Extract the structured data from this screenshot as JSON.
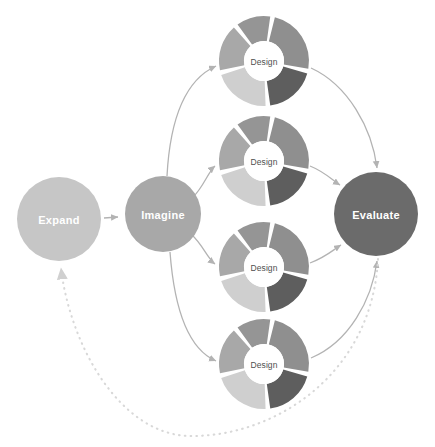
{
  "canvas": {
    "width": 435,
    "height": 447,
    "background": "#ffffff"
  },
  "colors": {
    "expand": "#c6c6c6",
    "imagine": "#a8a8a8",
    "evaluate": "#6b6b6b",
    "arrow": "#b3b3b3",
    "dotted": "#d8d8d8",
    "donut_gap": "#ffffff",
    "hub_fill": "#ffffff",
    "hub_text": "#4f4f4f",
    "node_text": "#ffffff",
    "wedge_light": "#d0d0d0",
    "wedge_light2": "#bdbdbd",
    "wedge_mid": "#a8a8a8",
    "wedge_mid2": "#959595",
    "wedge_dark": "#5e5e5e"
  },
  "nodes": [
    {
      "id": "expand",
      "label": "Expand",
      "cx": 59,
      "cy": 219,
      "r": 42,
      "fill": "#c6c6c6"
    },
    {
      "id": "imagine",
      "label": "Imagine",
      "cx": 163,
      "cy": 214,
      "r": 38,
      "fill": "#a8a8a8"
    },
    {
      "id": "evaluate",
      "label": "Evaluate",
      "cx": 376,
      "cy": 214,
      "r": 42,
      "fill": "#6b6b6b"
    }
  ],
  "donuts": [
    {
      "id": "design-1",
      "label": "Design",
      "cx": 264,
      "cy": 61,
      "r_outer": 45,
      "r_inner": 20
    },
    {
      "id": "design-2",
      "label": "Design",
      "cx": 264,
      "cy": 161,
      "r_outer": 45,
      "r_inner": 20
    },
    {
      "id": "design-3",
      "label": "Design",
      "cx": 264,
      "cy": 267,
      "r_outer": 45,
      "r_inner": 20
    },
    {
      "id": "design-4",
      "label": "Design",
      "cx": 264,
      "cy": 364,
      "r_outer": 45,
      "r_inner": 20
    }
  ],
  "donut_segments": [
    {
      "name": "segment-top-left",
      "start": 258,
      "end": 318,
      "fill": "#a8a8a8"
    },
    {
      "name": "segment-top-right",
      "start": 324,
      "end": 8,
      "fill": "#959595"
    },
    {
      "name": "segment-right",
      "start": 14,
      "end": 100,
      "fill": "#8f8f8f"
    },
    {
      "name": "segment-bottom",
      "start": 106,
      "end": 172,
      "fill": "#5e5e5e"
    },
    {
      "name": "segment-left",
      "start": 178,
      "end": 252,
      "fill": "#cfcfcf"
    }
  ],
  "edges": [
    {
      "name": "expand-to-imagine",
      "type": "solid",
      "from": "expand",
      "to": "imagine"
    },
    {
      "name": "imagine-to-design-1",
      "type": "solid",
      "from": "imagine",
      "to": "design-1"
    },
    {
      "name": "imagine-to-design-2",
      "type": "solid",
      "from": "imagine",
      "to": "design-2"
    },
    {
      "name": "imagine-to-design-3",
      "type": "solid",
      "from": "imagine",
      "to": "design-3"
    },
    {
      "name": "imagine-to-design-4",
      "type": "solid",
      "from": "imagine",
      "to": "design-4"
    },
    {
      "name": "design-1-to-evaluate",
      "type": "solid",
      "from": "design-1",
      "to": "evaluate"
    },
    {
      "name": "design-2-to-evaluate",
      "type": "solid",
      "from": "design-2",
      "to": "evaluate"
    },
    {
      "name": "design-3-to-evaluate",
      "type": "solid",
      "from": "design-3",
      "to": "evaluate"
    },
    {
      "name": "design-4-to-evaluate",
      "type": "solid",
      "from": "design-4",
      "to": "evaluate"
    },
    {
      "name": "evaluate-to-expand",
      "type": "dotted",
      "from": "evaluate",
      "to": "expand"
    }
  ],
  "labels": {
    "expand": "Expand",
    "imagine": "Imagine",
    "evaluate": "Evaluate",
    "design_1": "Design",
    "design_2": "Design",
    "design_3": "Design",
    "design_4": "Design"
  }
}
